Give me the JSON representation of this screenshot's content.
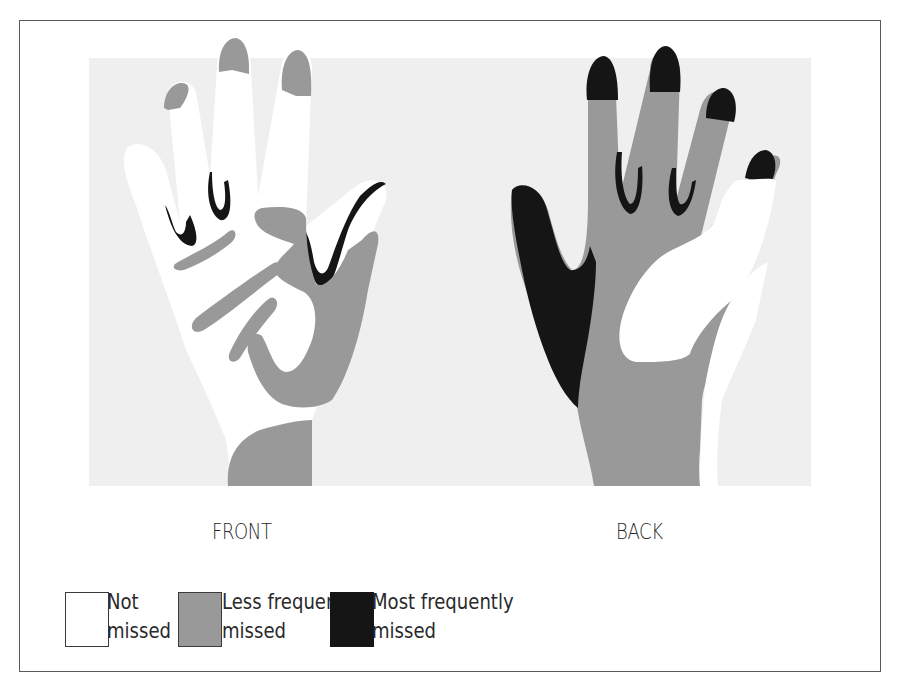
{
  "figure": {
    "hands": [
      {
        "id": "front",
        "label": "FRONT"
      },
      {
        "id": "back",
        "label": "BACK"
      }
    ],
    "legend": [
      {
        "id": "not-missed",
        "line1": "Not",
        "line2": "missed",
        "color": "#ffffff"
      },
      {
        "id": "less-frequently-missed",
        "line1": "Less frequently",
        "line2": "missed",
        "color": "#999999"
      },
      {
        "id": "most-frequently-missed",
        "line1": "Most frequently",
        "line2": "missed",
        "color": "#151515"
      }
    ],
    "colors": {
      "background_panel": "#efefef",
      "white_region": "#ffffff",
      "gray_region": "#999999",
      "black_region": "#151515",
      "frame_border": "#5a5a5a"
    }
  }
}
